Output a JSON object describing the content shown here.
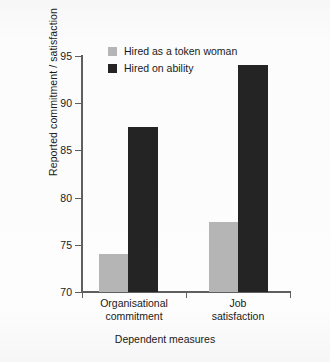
{
  "chart_data": {
    "type": "bar",
    "title": "",
    "xlabel": "Dependent measures",
    "ylabel": "Reported commitment / satisfaction",
    "categories": [
      "Organisational commitment",
      "Job satisfaction"
    ],
    "category_lines": [
      [
        "Organisational",
        "commitment"
      ],
      [
        "Job",
        "satisfaction"
      ]
    ],
    "series": [
      {
        "name": "Hired as a token woman",
        "color": "#b5b5b5",
        "values": [
          74.0,
          77.4
        ]
      },
      {
        "name": "Hired on ability",
        "color": "#242424",
        "values": [
          87.5,
          94.0
        ]
      }
    ],
    "ylim": [
      70,
      95
    ],
    "yticks": [
      70,
      75,
      80,
      85,
      90,
      95
    ],
    "ytick_labels": [
      "70",
      "75",
      "80",
      "85",
      "90",
      "95"
    ],
    "grid": false,
    "legend_position": "top-left-inside",
    "axis_color": "#5f5f5f",
    "background_color": "#fbfbfb"
  }
}
